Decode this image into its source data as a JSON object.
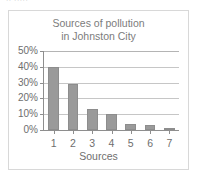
{
  "page": {
    "clipped_top_text": "·· ·····",
    "border_color": "#d8d8d8",
    "background": "#ffffff"
  },
  "chart_data": {
    "type": "bar",
    "title": "Sources of pollution in Johnston City",
    "title_lines": [
      "Sources of pollution",
      "in Johnston City"
    ],
    "xlabel": "Sources",
    "ylabel": "",
    "categories": [
      "1",
      "2",
      "3",
      "4",
      "5",
      "6",
      "7"
    ],
    "values": [
      40,
      29,
      13,
      10,
      4,
      3,
      1.5
    ],
    "ylim": [
      0,
      50
    ],
    "ytick_values": [
      0,
      10,
      20,
      30,
      40,
      50
    ],
    "ytick_labels": [
      "0%",
      "10%",
      "20%",
      "30%",
      "40%",
      "50%"
    ],
    "grid": true,
    "grid_axis": "y",
    "legend": false,
    "bar_color": "#9a9a9a",
    "bar_edge_color": "#8d8d8d",
    "axis_color": "#8e8e8e",
    "grid_color": "#c6c6c6",
    "text_color": "#6e6e6e"
  }
}
